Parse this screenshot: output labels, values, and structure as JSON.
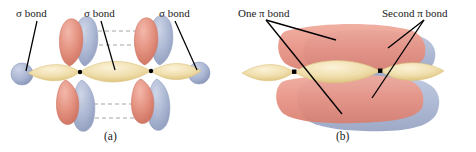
{
  "figure": {
    "background_color": "#ffffff"
  },
  "colors": {
    "sigma_lobe_yellow": "#f0dfae",
    "sigma_lobe_yellow_edge": "#dcc47f",
    "p_lobe_red": "#e4917f",
    "p_lobe_red_edge": "#cf7564",
    "p_lobe_blue": "#a9b5d2",
    "p_lobe_blue_edge": "#8e9cbd",
    "pi_cloud_red": "#e79183",
    "pi_cloud_blue": "#a7b3d0",
    "atom_dot": "#000000",
    "leader_line": "#000000",
    "dashed_guide": "#9a9a9a",
    "text": "#1a1a1a"
  },
  "panel_a": {
    "caption": "(a)",
    "labels": [
      {
        "id": "sigma-bond-left",
        "text": "σ bond"
      },
      {
        "id": "sigma-bond-center",
        "text": "σ bond"
      },
      {
        "id": "sigma-bond-right",
        "text": "σ bond"
      }
    ],
    "atoms": [
      {
        "id": "carbon-left",
        "symbol": "•"
      },
      {
        "id": "carbon-right",
        "symbol": "•"
      }
    ],
    "description": "Three sigma bonds along a linear axis shown as overlapping yellow lobes, with unhybridized p orbitals (red upper lobes, blue lower lobes) drawn separately above and below the axis and connected by gray dashed guide lines.",
    "sigma_bond_count": 3,
    "p_orbital_pair_count": 4,
    "dashed_guide_line_count": 4
  },
  "panel_b": {
    "caption": "(b)",
    "labels": [
      {
        "id": "one-pi-bond",
        "text": "One π bond"
      },
      {
        "id": "second-pi-bond",
        "text": "Second π bond"
      }
    ],
    "atoms": [
      {
        "id": "carbon-left",
        "symbol": "•"
      },
      {
        "id": "carbon-right",
        "symbol": "•"
      }
    ],
    "description": "The same molecule with the p orbitals merged into two continuous pi electron clouds: a red cloud above and below the sigma axis forming one pi bond, and a blue cloud in the perpendicular plane forming the second pi bond.",
    "pi_bond_count": 2,
    "leader_lines": {
      "one_pi_bond": 2,
      "second_pi_bond": 2
    }
  }
}
